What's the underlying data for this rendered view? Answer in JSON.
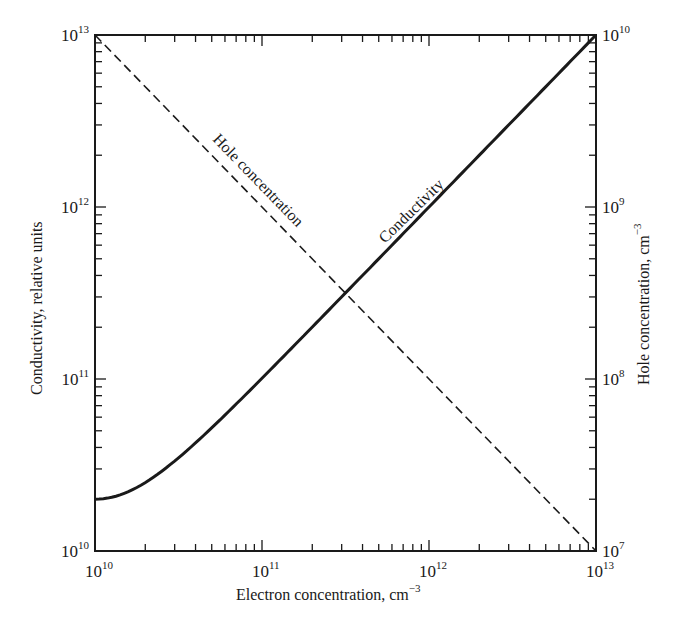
{
  "chart_data": {
    "type": "line",
    "title": "",
    "xlabel": "Electron concentration, cm⁻³",
    "xlabel_main": "Electron concentration, cm",
    "xlabel_exp": "−3",
    "ylabel_left": "Conductivity, relative units",
    "ylabel_right_main": "Hole concentration, cm",
    "ylabel_right_exp": "−3",
    "x_scale": "log",
    "y_left_scale": "log",
    "y_right_scale": "log",
    "xlim": [
      10000000000.0,
      10000000000000.0
    ],
    "ylim_left": [
      10000000000.0,
      10000000000000.0
    ],
    "ylim_right": [
      10000000.0,
      10000000000.0
    ],
    "x_ticks": [
      {
        "base": "10",
        "exp": "10",
        "value": 10000000000.0
      },
      {
        "base": "10",
        "exp": "11",
        "value": 100000000000.0
      },
      {
        "base": "10",
        "exp": "12",
        "value": 1000000000000.0
      },
      {
        "base": "10",
        "exp": "13",
        "value": 10000000000000.0
      }
    ],
    "y_left_ticks": [
      {
        "base": "10",
        "exp": "10",
        "value": 10000000000.0
      },
      {
        "base": "10",
        "exp": "11",
        "value": 100000000000.0
      },
      {
        "base": "10",
        "exp": "12",
        "value": 1000000000000.0
      },
      {
        "base": "10",
        "exp": "13",
        "value": 10000000000000.0
      }
    ],
    "y_right_ticks": [
      {
        "base": "10",
        "exp": "7",
        "value": 10000000.0
      },
      {
        "base": "10",
        "exp": "8",
        "value": 100000000.0
      },
      {
        "base": "10",
        "exp": "9",
        "value": 1000000000.0
      },
      {
        "base": "10",
        "exp": "10",
        "value": 10000000000.0
      }
    ],
    "grid": false,
    "legend": "none (curves labeled inline)",
    "series": [
      {
        "name": "Conductivity",
        "axis": "left",
        "style": "solid",
        "x": [
          10000000000.0,
          12500000000.0,
          15000000000.0,
          20000000000.0,
          30000000000.0,
          50000000000.0,
          100000000000.0,
          200000000000.0,
          316000000000.0,
          500000000000.0,
          1000000000000.0,
          2000000000000.0,
          5000000000000.0,
          10000000000000.0
        ],
        "values": [
          20000000000.0,
          20500000000.0,
          21700000000.0,
          25000000000.0,
          33300000000.0,
          52000000000.0,
          101000000000.0,
          200500000000.0,
          316300000000.0,
          500200000000.0,
          1000000000000.0,
          2000000000000.0,
          5000000000000.0,
          10000000000000.0
        ]
      },
      {
        "name": "Hole concentration",
        "axis": "right",
        "style": "dashed",
        "x": [
          10000000000.0,
          100000000000.0,
          316000000000.0,
          1000000000000.0,
          10000000000000.0
        ],
        "values": [
          10000000000.0,
          1000000000.0,
          316000000.0,
          100000000.0,
          10000000.0
        ]
      }
    ],
    "annotations": [
      {
        "text": "Hole concentration",
        "near_series": "Hole concentration"
      },
      {
        "text": "Conductivity",
        "near_series": "Conductivity"
      }
    ],
    "crossing_point": {
      "x": 316000000000.0,
      "y_left": 316000000000.0
    }
  },
  "style": {
    "line_color": "#1a1a1a",
    "background": "#ffffff"
  }
}
